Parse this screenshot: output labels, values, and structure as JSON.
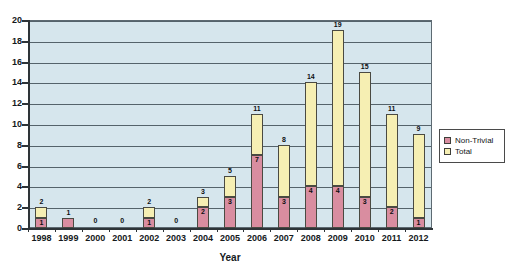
{
  "chart_data": {
    "type": "bar",
    "subtype": "stacked-column",
    "title": "",
    "xlabel": "Year",
    "ylabel": "",
    "ylim": [
      0,
      20
    ],
    "ytick_step": 2,
    "yticks": [
      0,
      2,
      4,
      6,
      8,
      10,
      12,
      14,
      16,
      18,
      20
    ],
    "grid": true,
    "legend_position": "right",
    "categories": [
      "1998",
      "1999",
      "2000",
      "2001",
      "2002",
      "2003",
      "2004",
      "2005",
      "2006",
      "2007",
      "2008",
      "2009",
      "2010",
      "2011",
      "2012"
    ],
    "series": [
      {
        "name": "Non-Trivial",
        "color": "#d98da0",
        "values": [
          1,
          1,
          0,
          0,
          1,
          0,
          2,
          3,
          7,
          3,
          4,
          4,
          3,
          2,
          1
        ]
      },
      {
        "name": "Total",
        "color": "#f6efb3",
        "values": [
          2,
          1,
          0,
          0,
          2,
          0,
          3,
          5,
          11,
          8,
          14,
          19,
          15,
          11,
          9
        ]
      }
    ],
    "data_labels": {
      "total": [
        "2",
        "1",
        "0",
        "0",
        "2",
        "0",
        "3",
        "5",
        "11",
        "8",
        "14",
        "19",
        "15",
        "11",
        "9"
      ],
      "non_trivial": [
        "1",
        "",
        "",
        "",
        "1",
        "",
        "2",
        "3",
        "7",
        "3",
        "4",
        "4",
        "3",
        "2",
        "1"
      ]
    },
    "plot_background": "#d6e6ed"
  },
  "legend": {
    "items": [
      {
        "label": "Non-Trivial",
        "swatch": "nontrivial"
      },
      {
        "label": "Total",
        "swatch": "total"
      }
    ]
  }
}
